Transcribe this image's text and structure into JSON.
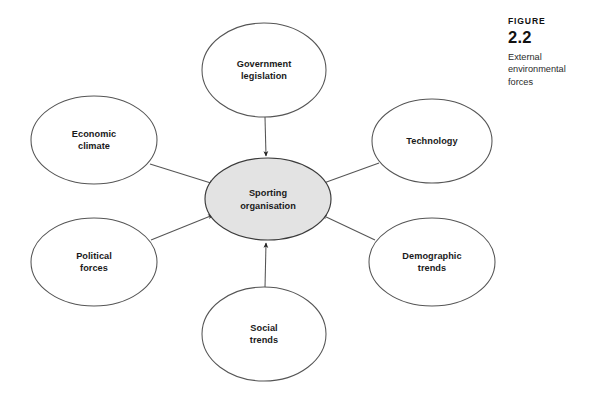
{
  "caption": {
    "figure_word": "FIGURE",
    "figure_number": "2.2",
    "description": "External\nenvironmental\nforces"
  },
  "diagram": {
    "type": "hub-and-spoke",
    "center": {
      "id": "sporting-organisation",
      "label": "Sporting\norganisation",
      "fill_color": "#e3e3e3",
      "stroke_color": "#3b3b3b",
      "cx": 268,
      "cy": 199,
      "rx": 63,
      "ry": 41
    },
    "stroke_color": "#555555",
    "node_fill_color": "#ffffff",
    "arrow_color": "#222222",
    "nodes": [
      {
        "id": "government-legislation",
        "label": "Government\nlegislation",
        "cx": 264,
        "cy": 70,
        "rx": 62,
        "ry": 47
      },
      {
        "id": "technology",
        "label": "Technology",
        "cx": 432,
        "cy": 141,
        "rx": 60,
        "ry": 42
      },
      {
        "id": "demographic-trends",
        "label": "Demographic\ntrends",
        "cx": 432,
        "cy": 262,
        "rx": 63,
        "ry": 44
      },
      {
        "id": "social-trends",
        "label": "Social\ntrends",
        "cx": 264,
        "cy": 334,
        "rx": 62,
        "ry": 47
      },
      {
        "id": "political-forces",
        "label": "Political\nforces",
        "cx": 94,
        "cy": 262,
        "rx": 63,
        "ry": 44
      },
      {
        "id": "economic-climate",
        "label": "Economic\nclimate",
        "cx": 94,
        "cy": 140,
        "rx": 63,
        "ry": 44
      }
    ],
    "connectors": [
      {
        "from": "government-legislation",
        "to": "sporting-organisation",
        "direction": "inward"
      },
      {
        "from": "technology",
        "to": "sporting-organisation",
        "direction": "inward"
      },
      {
        "from": "demographic-trends",
        "to": "sporting-organisation",
        "direction": "inward"
      },
      {
        "from": "social-trends",
        "to": "sporting-organisation",
        "direction": "inward"
      },
      {
        "from": "political-forces",
        "to": "sporting-organisation",
        "direction": "inward"
      },
      {
        "from": "economic-climate",
        "to": "sporting-organisation",
        "direction": "inward"
      }
    ]
  }
}
